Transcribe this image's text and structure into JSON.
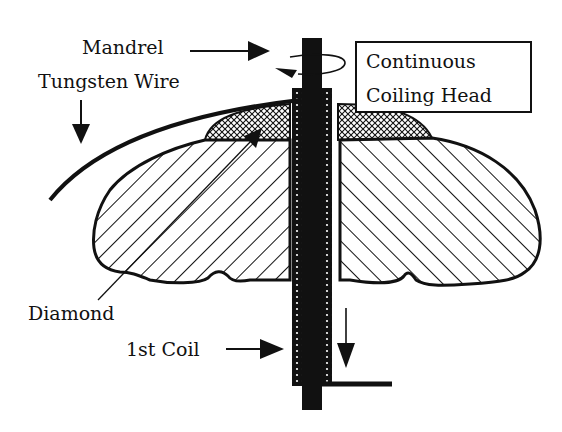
{
  "diagram": {
    "labels": {
      "mandrel": "Mandrel",
      "tungsten_wire": "Tungsten Wire",
      "diamond": "Diamond",
      "first_coil": "1st Coil"
    },
    "box": {
      "line1": "Continuous",
      "line2": "Coiling Head"
    },
    "colors": {
      "ink": "#111111",
      "background": "#ffffff"
    }
  }
}
